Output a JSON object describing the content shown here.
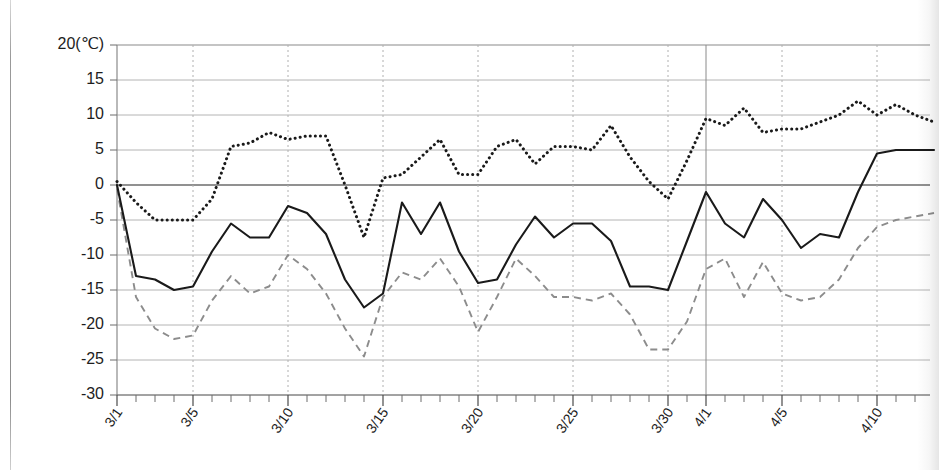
{
  "chart_data": {
    "type": "line",
    "title": "",
    "xlabel": "",
    "ylabel": "20(℃)",
    "ylim": [
      -30,
      20
    ],
    "ytick_labels": [
      "20(℃)",
      "15",
      "10",
      "5",
      "0",
      "-5",
      "-10",
      "-15",
      "-20",
      "-25",
      "-30"
    ],
    "ytick_values": [
      20,
      15,
      10,
      5,
      0,
      -5,
      -10,
      -15,
      -20,
      -25,
      -30
    ],
    "grid": "horizontal-solid-vertical-dotted",
    "legend": "none",
    "x": [
      "3/1",
      "3/2",
      "3/3",
      "3/4",
      "3/5",
      "3/6",
      "3/7",
      "3/8",
      "3/9",
      "3/10",
      "3/11",
      "3/12",
      "3/13",
      "3/14",
      "3/15",
      "3/16",
      "3/17",
      "3/18",
      "3/19",
      "3/20",
      "3/21",
      "3/22",
      "3/23",
      "3/24",
      "3/25",
      "3/26",
      "3/27",
      "3/28",
      "3/29",
      "3/30",
      "3/31",
      "4/1",
      "4/2",
      "4/3",
      "4/4",
      "4/5",
      "4/6",
      "4/7",
      "4/8",
      "4/9",
      "4/10",
      "4/11",
      "4/12",
      "4/13"
    ],
    "xtick_labels": [
      "3/1",
      "3/5",
      "3/10",
      "3/15",
      "3/20",
      "3/25",
      "3/30",
      "4/1",
      "4/5",
      "4/10"
    ],
    "xtick_indices": [
      0,
      4,
      9,
      14,
      19,
      24,
      29,
      31,
      35,
      40
    ],
    "vgrid_indices": [
      4,
      9,
      14,
      19,
      24,
      29,
      35,
      40
    ],
    "vgrid_solid_indices": [
      31
    ],
    "series": [
      {
        "name": "maximum-temperature",
        "style": "dotted",
        "color": "#1a1a1a",
        "values": [
          0.5,
          -2.5,
          -5.0,
          -5.0,
          -5.0,
          -2.0,
          5.5,
          6.0,
          7.5,
          6.5,
          7.0,
          7.0,
          0.0,
          -7.5,
          1.0,
          1.5,
          4.0,
          6.5,
          1.5,
          1.5,
          5.5,
          6.5,
          3.0,
          5.5,
          5.5,
          5.0,
          8.5,
          4.0,
          0.5,
          -2.0,
          3.5,
          9.5,
          8.5,
          11.0,
          7.5,
          8.0,
          8.0,
          9.0,
          10.0,
          12.0,
          10.0,
          11.5,
          10.0,
          9.0
        ]
      },
      {
        "name": "mean-temperature",
        "style": "solid",
        "color": "#1a1a1a",
        "values": [
          0.0,
          -13.0,
          -13.5,
          -15.0,
          -14.5,
          -9.5,
          -5.5,
          -7.5,
          -7.5,
          -3.0,
          -4.0,
          -7.0,
          -13.5,
          -17.5,
          -15.5,
          -2.5,
          -7.0,
          -2.5,
          -9.5,
          -14.0,
          -13.5,
          -8.5,
          -4.5,
          -7.5,
          -5.5,
          -5.5,
          -8.0,
          -14.5,
          -14.5,
          -15.0,
          -8.0,
          -1.0,
          -5.5,
          -7.5,
          -2.0,
          -5.0,
          -9.0,
          -7.0,
          -7.5,
          -1.0,
          4.5,
          5.0,
          5.0,
          5.0
        ]
      },
      {
        "name": "minimum-temperature",
        "style": "dashed",
        "color": "#8c8c8c",
        "values": [
          -0.5,
          -16.0,
          -20.5,
          -22.0,
          -21.5,
          -16.5,
          -13.0,
          -15.5,
          -14.5,
          -10.0,
          -12.0,
          -15.5,
          -20.5,
          -24.5,
          -16.0,
          -12.5,
          -13.5,
          -10.5,
          -14.5,
          -21.0,
          -16.0,
          -10.5,
          -13.0,
          -16.0,
          -16.0,
          -16.5,
          -15.5,
          -18.5,
          -23.5,
          -23.5,
          -19.5,
          -12.0,
          -10.5,
          -16.0,
          -11.0,
          -15.5,
          -16.5,
          -16.0,
          -13.5,
          -9.0,
          -6.0,
          -5.0,
          -4.5,
          -4.0
        ]
      }
    ]
  }
}
